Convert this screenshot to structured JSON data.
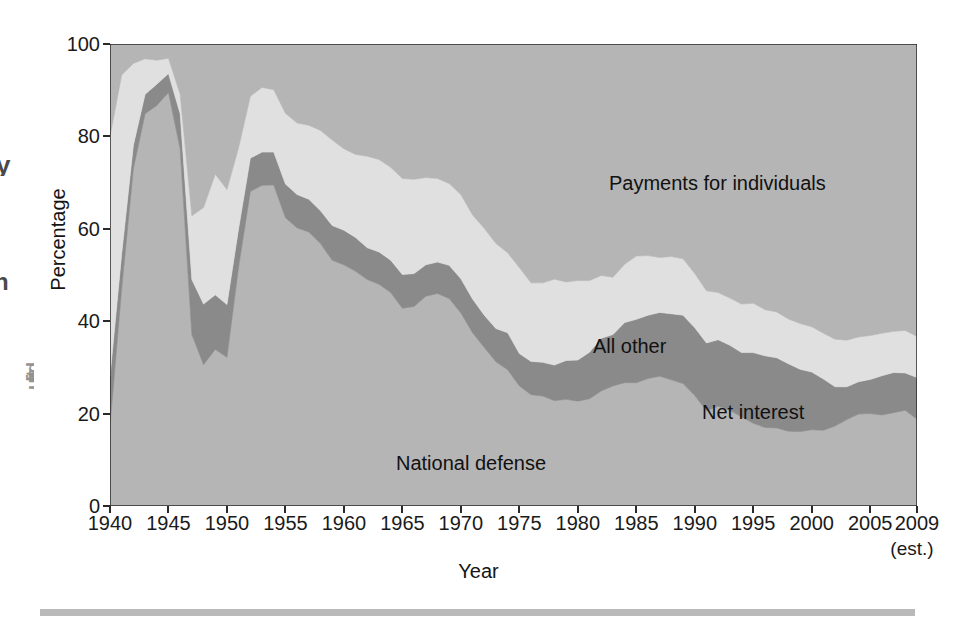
{
  "chart_data": {
    "type": "area",
    "stacked": true,
    "title": "",
    "xlabel": "Year",
    "ylabel": "Percentage",
    "xlim": [
      1940,
      2009
    ],
    "ylim": [
      0,
      100
    ],
    "grid": false,
    "legend_position": "in-plot annotations",
    "x_tick_labels": [
      "1940",
      "1945",
      "1950",
      "1955",
      "1960",
      "1965",
      "1970",
      "1975",
      "1980",
      "1985",
      "1990",
      "1995",
      "2000",
      "2005",
      "2009"
    ],
    "x_ticks": [
      1940,
      1945,
      1950,
      1955,
      1960,
      1965,
      1970,
      1975,
      1980,
      1985,
      1990,
      1995,
      2000,
      2005,
      2009
    ],
    "y_tick_labels": [
      "0",
      "20",
      "40",
      "60",
      "80",
      "100"
    ],
    "y_ticks": [
      0,
      20,
      40,
      60,
      80,
      100
    ],
    "x_axis_note": "(est.)",
    "x": [
      1940,
      1941,
      1942,
      1943,
      1944,
      1945,
      1946,
      1947,
      1948,
      1949,
      1950,
      1951,
      1952,
      1953,
      1954,
      1955,
      1956,
      1957,
      1958,
      1959,
      1960,
      1961,
      1962,
      1963,
      1964,
      1965,
      1966,
      1967,
      1968,
      1969,
      1970,
      1971,
      1972,
      1973,
      1974,
      1975,
      1976,
      1977,
      1978,
      1979,
      1980,
      1981,
      1982,
      1983,
      1984,
      1985,
      1986,
      1987,
      1988,
      1989,
      1990,
      1991,
      1992,
      1993,
      1994,
      1995,
      1996,
      1997,
      1998,
      1999,
      2000,
      2001,
      2002,
      2003,
      2004,
      2005,
      2006,
      2007,
      2008,
      2009
    ],
    "series": [
      {
        "name": "National defense",
        "color": "#b5b5b5",
        "order": 1,
        "values": [
          17.5,
          47.1,
          73.0,
          84.9,
          86.7,
          89.5,
          77.3,
          37.1,
          30.6,
          33.9,
          32.2,
          51.8,
          68.1,
          69.4,
          69.5,
          62.4,
          60.2,
          59.3,
          56.8,
          53.2,
          52.2,
          50.8,
          49.0,
          48.0,
          46.2,
          42.8,
          43.2,
          45.4,
          46.0,
          44.9,
          41.8,
          37.5,
          34.3,
          31.2,
          29.5,
          26.0,
          24.1,
          23.8,
          22.8,
          23.1,
          22.7,
          23.2,
          24.9,
          26.0,
          26.7,
          26.7,
          27.6,
          28.1,
          27.3,
          26.5,
          23.9,
          20.6,
          21.6,
          20.7,
          19.3,
          17.9,
          17.0,
          16.9,
          16.2,
          16.1,
          16.5,
          16.4,
          17.3,
          18.7,
          19.9,
          20.0,
          19.7,
          20.2,
          20.7,
          18.8
        ]
      },
      {
        "name": "Net interest",
        "color": "#8a8a8a",
        "order": 2,
        "values": [
          10.5,
          7.5,
          5.1,
          4.2,
          4.6,
          4.1,
          7.6,
          11.9,
          13.1,
          11.8,
          11.4,
          8.3,
          7.2,
          7.2,
          7.1,
          7.3,
          7.2,
          7.1,
          7.1,
          7.5,
          7.5,
          7.3,
          6.9,
          7.0,
          7.0,
          7.3,
          7.1,
          6.8,
          6.8,
          7.2,
          7.4,
          7.3,
          7.0,
          7.2,
          8.0,
          7.0,
          7.2,
          7.3,
          7.7,
          8.4,
          8.9,
          10.1,
          11.4,
          11.1,
          13.0,
          13.7,
          13.7,
          13.8,
          14.3,
          14.8,
          14.7,
          14.7,
          14.4,
          14.1,
          13.9,
          15.3,
          15.5,
          15.2,
          14.6,
          13.5,
          12.5,
          11.1,
          8.5,
          7.1,
          7.0,
          7.4,
          8.5,
          8.7,
          8.1,
          9.0
        ]
      },
      {
        "name": "All other",
        "color": "#e0e0e0",
        "order": 3,
        "values": [
          52.0,
          38.7,
          17.7,
          7.7,
          5.2,
          3.3,
          4.2,
          13.8,
          20.9,
          26.1,
          24.9,
          17.5,
          13.4,
          14.0,
          13.5,
          15.3,
          15.5,
          16.0,
          17.4,
          18.5,
          17.6,
          18.0,
          19.8,
          20.0,
          20.1,
          20.8,
          20.4,
          18.9,
          18.1,
          17.7,
          18.2,
          18.2,
          18.8,
          18.4,
          17.3,
          18.6,
          17.0,
          17.2,
          18.6,
          17.0,
          17.2,
          15.5,
          13.6,
          12.4,
          12.6,
          13.7,
          12.9,
          11.9,
          12.4,
          12.2,
          11.7,
          11.3,
          10.2,
          10.2,
          10.5,
          10.7,
          10.0,
          9.9,
          9.7,
          9.9,
          9.8,
          9.9,
          10.3,
          10.1,
          9.7,
          9.5,
          9.2,
          8.9,
          9.2,
          8.9
        ]
      },
      {
        "name": "Payments for individuals",
        "color": "#b5b5b5",
        "order": 4,
        "values": [
          20.0,
          6.7,
          4.2,
          3.2,
          3.5,
          3.1,
          10.9,
          37.2,
          35.4,
          28.2,
          31.5,
          22.4,
          11.3,
          9.4,
          9.9,
          15.0,
          17.1,
          17.6,
          18.7,
          20.8,
          22.7,
          23.9,
          24.3,
          25.0,
          26.7,
          29.1,
          29.3,
          28.9,
          29.1,
          30.2,
          32.6,
          37.0,
          39.9,
          43.2,
          45.2,
          48.4,
          51.7,
          51.7,
          50.9,
          51.5,
          51.2,
          51.2,
          50.1,
          50.5,
          47.7,
          45.9,
          45.8,
          46.2,
          46.0,
          46.5,
          49.7,
          53.4,
          53.8,
          55.0,
          56.3,
          56.1,
          57.5,
          58.0,
          59.5,
          60.5,
          61.2,
          62.6,
          63.9,
          64.1,
          63.4,
          63.1,
          62.6,
          62.2,
          62.0,
          63.3
        ]
      }
    ],
    "annotations": [
      {
        "name": "payments-for-individuals-label",
        "text": "Payments for individuals"
      },
      {
        "name": "all-other-label",
        "text": "All other"
      },
      {
        "name": "net-interest-label",
        "text": "Net interest"
      },
      {
        "name": "national-defense-label",
        "text": "National defense"
      }
    ]
  },
  "axes": {
    "y_label": "Percentage",
    "x_label": "Year",
    "x_note": "(est.)"
  },
  "labels": {
    "payments": "Payments for individuals",
    "all_other": "All other",
    "net_interest": "Net interest",
    "national_defense": "National defense"
  },
  "colors": {
    "background": "#ffffff",
    "national_defense": "#b5b5b5",
    "net_interest": "#8a8a8a",
    "all_other": "#e0e0e0",
    "payments_for_individuals": "#b5b5b5",
    "axis": "#2a2a2a",
    "text": "#141414",
    "rule": "#b9b9b9"
  },
  "margin_fragments": {
    "frag_a": "y",
    "frag_b": "n",
    "frag_c": "ulitd"
  }
}
